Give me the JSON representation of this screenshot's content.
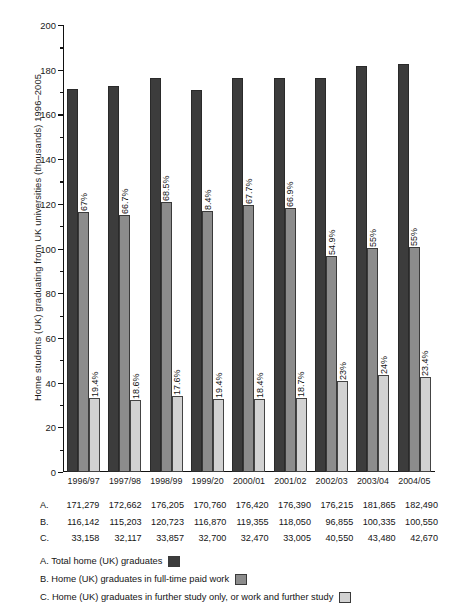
{
  "chart_data": {
    "type": "bar",
    "title": "",
    "subtitle": "",
    "xlabel": "",
    "ylabel": "Home students (UK) graduating from UK universities (thousands) 1996–2005",
    "ylim": [
      0,
      200
    ],
    "ytick_step": 20,
    "yminor_step": 10,
    "grid": false,
    "legend_position": "below-table",
    "categories": [
      "1996/97",
      "1997/98",
      "1998/99",
      "1999/20",
      "2000/01",
      "2001/02",
      "2002/03",
      "2003/04",
      "2004/05"
    ],
    "yticks": [
      "0",
      "20",
      "40",
      "60",
      "80",
      "100",
      "120",
      "140",
      "160",
      "180",
      "200"
    ],
    "series": [
      {
        "key": "A",
        "name": "Total home (UK) graduates",
        "color": "#3c3c3c",
        "values": [
          171279,
          172662,
          176205,
          170760,
          176420,
          176390,
          176215,
          181865,
          182490
        ],
        "values_thousands": [
          171.279,
          172.662,
          176.205,
          170.76,
          176.42,
          176.39,
          176.215,
          181.865,
          182.49
        ],
        "labels": [
          "171,279",
          "172,662",
          "176,205",
          "170,760",
          "176,420",
          "176,390",
          "176,215",
          "181,865",
          "182,490"
        ],
        "bar_labels": [
          "",
          "",
          "",
          "",
          "",
          "",
          "",
          "",
          ""
        ]
      },
      {
        "key": "B",
        "name": "Home (UK) graduates in full-time paid work",
        "color": "#8c8c8c",
        "values": [
          116142,
          115203,
          120723,
          116870,
          119355,
          118050,
          96855,
          100335,
          100550
        ],
        "values_thousands": [
          116.142,
          115.203,
          120.723,
          116.87,
          119.355,
          118.05,
          96.855,
          100.335,
          100.55
        ],
        "labels": [
          "116,142",
          "115,203",
          "120,723",
          "116,870",
          "119,355",
          "118,050",
          "96,855",
          "100,335",
          "100,550"
        ],
        "bar_labels": [
          "67%",
          "66.7%",
          "68.5%",
          "8.4%",
          "67.7%",
          "66.9%",
          "54.9%",
          "55%",
          "55%"
        ]
      },
      {
        "key": "C",
        "name": "Home (UK) graduates in further study only, or work and further study",
        "color": "#d2d2d2",
        "values": [
          33158,
          32117,
          33857,
          32700,
          32470,
          33005,
          40550,
          43480,
          42670
        ],
        "values_thousands": [
          33.158,
          32.117,
          33.857,
          32.7,
          32.47,
          33.005,
          40.55,
          43.48,
          42.67
        ],
        "labels": [
          "33,158",
          "32,117",
          "33,857",
          "32,700",
          "32,470",
          "33,005",
          "40,550",
          "43,480",
          "42,670"
        ],
        "bar_labels": [
          "19.4%",
          "18.6%",
          "17.6%",
          "19.4%",
          "18.4%",
          "18.7%",
          "23%",
          "24%",
          "23.4%"
        ]
      }
    ]
  },
  "table": {
    "row_labels": [
      "A.",
      "B.",
      "C."
    ]
  },
  "legend": {
    "items": [
      {
        "text": "A. Total home (UK) graduates",
        "swatch": "a"
      },
      {
        "text": "B. Home (UK) graduates in full-time paid work",
        "swatch": "b"
      },
      {
        "text": "C. Home (UK) graduates in further study only, or work and further study",
        "swatch": "c"
      }
    ]
  }
}
